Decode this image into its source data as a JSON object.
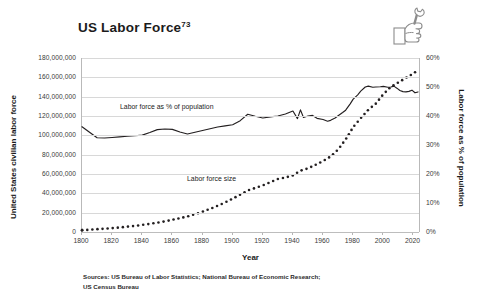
{
  "title": "US Labor Force",
  "title_superscript": "73",
  "icon": "hand-wrench-icon",
  "source_note_line1": "Sources: US Bureau of Labor Statistics; National Bureau of Economic Research;",
  "source_note_line2": "US Census Bureau",
  "colors": {
    "line": "#231f20",
    "grid": "#d8d8d8",
    "text": "#231f20",
    "background": "#ffffff"
  },
  "chart_data": {
    "type": "line",
    "title": "US Labor Force",
    "xlabel": "Year",
    "ylabel": "United States civilian labor force",
    "ylabel_right": "Labor force as % of population",
    "grid": true,
    "legend": "inline-annotations",
    "xlim": [
      1800,
      2025
    ],
    "ylim": [
      0,
      180000000
    ],
    "ylim_right": [
      0,
      60
    ],
    "xticks": [
      1800,
      1820,
      1840,
      1860,
      1880,
      1900,
      1920,
      1940,
      1960,
      1980,
      2000,
      2020
    ],
    "xticklabels": [
      "1800",
      "1820",
      "1840",
      "1860",
      "1880",
      "1900",
      "1920",
      "1940",
      "1960",
      "1980",
      "2000",
      "2020"
    ],
    "yticks_left": [
      0,
      20000000,
      40000000,
      60000000,
      80000000,
      100000000,
      120000000,
      140000000,
      160000000,
      180000000
    ],
    "yticklabels_left": [
      "0",
      "20,000,000",
      "40,000,000",
      "60,000,000",
      "80,000,000",
      "100,000,000",
      "120,000,000",
      "140,000,000",
      "160,000,000",
      "180,000,000"
    ],
    "yticks_right": [
      0,
      10,
      20,
      30,
      40,
      50,
      60
    ],
    "yticklabels_right": [
      "0%",
      "10%",
      "20%",
      "30%",
      "40%",
      "50%",
      "60%"
    ],
    "annotations": [
      {
        "text": "Labor force as % of population",
        "series": "pct-of-population"
      },
      {
        "text": "Labor force size",
        "series": "labor-force-size"
      }
    ],
    "series": [
      {
        "name": "Labor force as % of population",
        "style": "solid",
        "axis": "right",
        "unit": "percent",
        "x": [
          1800,
          1805,
          1810,
          1815,
          1820,
          1825,
          1830,
          1835,
          1840,
          1845,
          1850,
          1855,
          1860,
          1865,
          1870,
          1875,
          1880,
          1885,
          1890,
          1895,
          1900,
          1905,
          1910,
          1915,
          1920,
          1925,
          1930,
          1935,
          1940,
          1943,
          1945,
          1947,
          1950,
          1953,
          1956,
          1960,
          1963,
          1965,
          1968,
          1970,
          1973,
          1975,
          1978,
          1980,
          1983,
          1985,
          1988,
          1990,
          1993,
          1995,
          1998,
          2000,
          2003,
          2005,
          2007,
          2009,
          2011,
          2013,
          2015,
          2017,
          2019,
          2021,
          2023
        ],
        "y": [
          36.3,
          34.4,
          32.5,
          32.4,
          32.6,
          32.8,
          33.0,
          33.2,
          33.4,
          34.3,
          35.3,
          35.5,
          35.4,
          34.5,
          33.8,
          34.4,
          35.0,
          35.6,
          36.2,
          36.6,
          37.0,
          38.4,
          40.6,
          39.9,
          39.3,
          39.7,
          40.0,
          40.7,
          41.7,
          39.1,
          42.1,
          39.5,
          40.0,
          40.2,
          39.2,
          38.8,
          38.2,
          38.5,
          39.3,
          40.1,
          41.2,
          42.0,
          44.2,
          45.8,
          47.3,
          48.6,
          50.0,
          50.3,
          49.9,
          50.0,
          50.1,
          50.2,
          49.9,
          50.0,
          50.3,
          49.6,
          48.8,
          48.4,
          48.3,
          48.5,
          48.9,
          48.0,
          48.3
        ]
      },
      {
        "name": "Labor force size",
        "style": "dotted",
        "axis": "left",
        "unit": "persons",
        "x": [
          1800,
          1805,
          1810,
          1815,
          1820,
          1825,
          1830,
          1835,
          1840,
          1845,
          1850,
          1855,
          1860,
          1865,
          1870,
          1875,
          1880,
          1885,
          1890,
          1895,
          1900,
          1905,
          1910,
          1915,
          1920,
          1925,
          1930,
          1935,
          1940,
          1945,
          1950,
          1955,
          1960,
          1965,
          1970,
          1975,
          1980,
          1985,
          1990,
          1995,
          2000,
          2005,
          2010,
          2015,
          2020,
          2023
        ],
        "y": [
          1900000,
          2300000,
          2900000,
          3400000,
          4000000,
          4700000,
          5500000,
          6300000,
          7300000,
          8400000,
          9700000,
          11000000,
          12600000,
          14300000,
          16100000,
          18400000,
          21000000,
          23900000,
          27100000,
          30600000,
          34500000,
          38600000,
          42900000,
          45600000,
          48200000,
          51500000,
          54800000,
          56300000,
          58600000,
          63400000,
          65800000,
          69500000,
          73400000,
          78100000,
          85400000,
          95800000,
          108500000,
          117800000,
          126400000,
          132800000,
          142500000,
          150200000,
          154700000,
          159500000,
          164000000,
          167500000
        ]
      }
    ]
  }
}
